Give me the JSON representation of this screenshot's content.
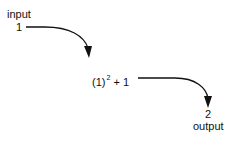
{
  "diagram": {
    "input_label": "input",
    "input_value": "1",
    "expression": {
      "base": "(1)",
      "exponent": "2",
      "rest": " + 1"
    },
    "output_value": "2",
    "output_label": "output",
    "colors": {
      "stroke": "#111111",
      "background": "#ffffff"
    }
  }
}
